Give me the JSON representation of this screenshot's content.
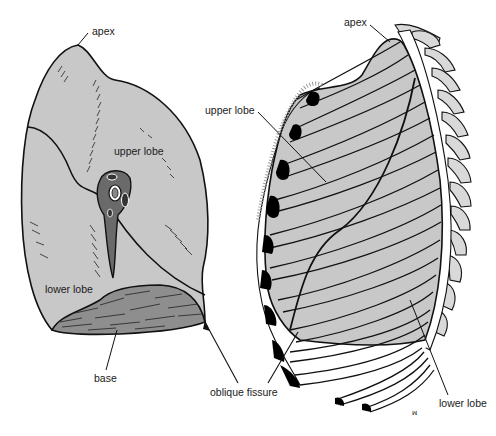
{
  "figure": {
    "colors": {
      "lung_fill": "#c8c8c8",
      "outline": "#111111",
      "hilum_fill": "#6a6a6a",
      "cartilage_fill": "#000000",
      "vertebra_fill": "#d9d9d9",
      "background": "#ffffff"
    }
  },
  "left_view": {
    "name": "medial view of lung",
    "labels": {
      "apex": "apex",
      "upper_lobe": "upper lobe",
      "lower_lobe": "lower lobe",
      "base": "base"
    }
  },
  "right_view": {
    "name": "lateral view of lung within ribcage",
    "labels": {
      "apex": "apex",
      "upper_lobe": "upper lobe",
      "lower_lobe": "lower lobe"
    }
  },
  "shared": {
    "oblique_fissure": "oblique fissure"
  }
}
